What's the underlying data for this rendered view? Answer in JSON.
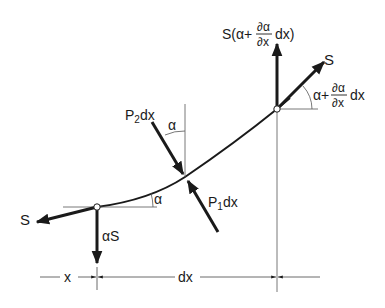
{
  "diagram": {
    "labels": {
      "s_left": "S",
      "alpha_s": "αS",
      "s_right": "S",
      "s_vertical_prefix": "S(α+",
      "s_vertical_suffix": "dx)",
      "partial_num": "∂α",
      "partial_den": "∂x",
      "angle_right_prefix": "α+",
      "angle_right_suffix": "dx",
      "p2": "P",
      "p2_sub": "2",
      "p2_suffix": "dx",
      "p1": "P",
      "p1_sub": "1",
      "p1_suffix": "dx",
      "alpha_top": "α",
      "alpha_bottom": "α",
      "dim_x": "x",
      "dim_dx": "dx"
    },
    "colors": {
      "ink": "#1a1a1a",
      "thin": "#444444",
      "background": "#ffffff"
    }
  }
}
